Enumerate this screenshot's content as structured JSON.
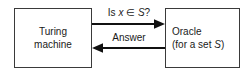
{
  "diagram": {
    "background_color": "#ffffff",
    "stroke_color": "#3a3a3a",
    "text_color": "#1a1a1a",
    "nodes": [
      {
        "id": "turing-machine",
        "line1": "Turing",
        "line2": "machine",
        "x": 14,
        "y": 8,
        "width": 78,
        "height": 60
      },
      {
        "id": "oracle",
        "line1": "Oracle",
        "line2_prefix": "(for a set ",
        "line2_italic": "S",
        "line2_suffix": ")",
        "x": 165,
        "y": 8,
        "width": 75,
        "height": 60
      }
    ],
    "edges": [
      {
        "id": "query-edge",
        "label_prefix": "Is ",
        "label_italic_1": "x",
        "label_middle": " ∈ ",
        "label_italic_2": "S",
        "label_suffix": "?",
        "direction": "right",
        "from": "turing-machine",
        "to": "oracle",
        "y": 24
      },
      {
        "id": "answer-edge",
        "label": "Answer",
        "direction": "left",
        "from": "oracle",
        "to": "turing-machine",
        "y": 48
      }
    ]
  }
}
